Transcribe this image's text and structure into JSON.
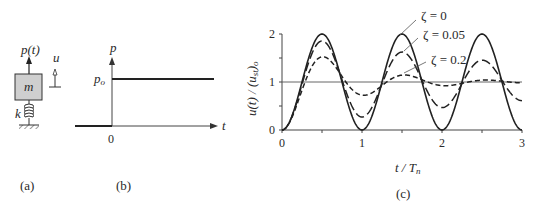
{
  "panels": {
    "a": {
      "caption": "(a)",
      "force_label": "p(t)",
      "mass_label": "m",
      "spring_label": "k",
      "disp_label": "u",
      "mass_fill": "#cfcfcf"
    },
    "b": {
      "caption": "(b)",
      "y_axis_label": "p",
      "x_axis_label": "t",
      "level_label": "p",
      "level_sub": "o",
      "origin_label": "0"
    },
    "c": {
      "caption": "(c)",
      "ylabel_main": "u(t) / (u",
      "ylabel_sub": "st",
      "ylabel_end": ")",
      "ylabel_end_sub": "o",
      "xlabel_t": "t / T",
      "xlabel_sub": "n",
      "legend": [
        "ζ = 0",
        "ζ = 0.05",
        "ζ = 0.2"
      ]
    }
  },
  "chart_data": {
    "type": "line",
    "title": "",
    "xlabel": "t / T_n",
    "ylabel": "u(t) / (u_st)_o",
    "xlim": [
      0,
      3
    ],
    "ylim": [
      0,
      2
    ],
    "xticks": [
      "0",
      "1",
      "2",
      "3"
    ],
    "yticks": [
      "0",
      "1",
      "2"
    ],
    "reference_line": 1,
    "series": [
      {
        "name": "ζ = 0",
        "zeta": 0,
        "style": "solid",
        "x": [
          0,
          0.25,
          0.5,
          0.75,
          1.0,
          1.25,
          1.5,
          1.75,
          2.0,
          2.25,
          2.5,
          2.75,
          3.0
        ],
        "values": [
          0,
          1.0,
          2.0,
          1.0,
          0,
          1.0,
          2.0,
          1.0,
          0,
          1.0,
          2.0,
          1.0,
          0
        ]
      },
      {
        "name": "ζ = 0.05",
        "zeta": 0.05,
        "style": "long-dash",
        "x": [
          0,
          0.5,
          1.0,
          1.5,
          2.0,
          2.5,
          3.0
        ],
        "values": [
          0,
          1.85,
          0.27,
          1.62,
          0.47,
          1.46,
          0.61
        ]
      },
      {
        "name": "ζ = 0.2",
        "zeta": 0.2,
        "style": "short-dash",
        "x": [
          0,
          0.5,
          1.0,
          1.5,
          2.0,
          2.5,
          3.0
        ],
        "values": [
          0,
          1.53,
          0.72,
          1.13,
          0.94,
          1.03,
          0.99
        ]
      }
    ]
  }
}
